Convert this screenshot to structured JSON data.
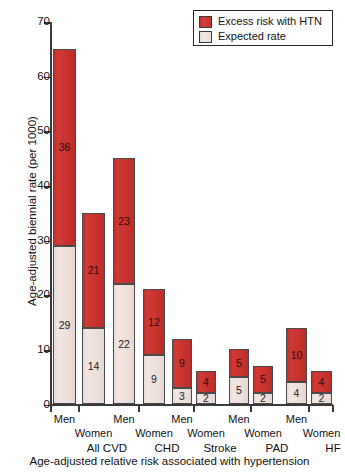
{
  "chart_data": {
    "type": "bar",
    "title": "",
    "subtitle": "",
    "xlabel": "Age-adjusted relative risk associated with hypertension",
    "ylabel": "Age-adjusted biennial rate (per 1000)",
    "ylim": [
      0,
      70
    ],
    "yticks": [
      0,
      10,
      20,
      30,
      40,
      50,
      60,
      70
    ],
    "grid": false,
    "stacked": true,
    "legend_position": "top-right",
    "categories": [
      "All CVD Men",
      "All CVD Women",
      "CHD Men",
      "CHD Women",
      "Stroke Men",
      "Stroke Women",
      "PAD Men",
      "PAD Women",
      "HF Men",
      "HF Women"
    ],
    "groups": [
      {
        "name": "All CVD",
        "bars": [
          {
            "sex": "Men",
            "expected": 29,
            "excess": 36,
            "total": 65
          },
          {
            "sex": "Women",
            "expected": 14,
            "excess": 21,
            "total": 35
          }
        ]
      },
      {
        "name": "CHD",
        "bars": [
          {
            "sex": "Men",
            "expected": 22,
            "excess": 23,
            "total": 45
          },
          {
            "sex": "Women",
            "expected": 9,
            "excess": 12,
            "total": 21
          }
        ]
      },
      {
        "name": "Stroke",
        "bars": [
          {
            "sex": "Men",
            "expected": 3,
            "excess": 9,
            "total": 12
          },
          {
            "sex": "Women",
            "expected": 2,
            "excess": 4,
            "total": 6
          }
        ]
      },
      {
        "name": "PAD",
        "bars": [
          {
            "sex": "Men",
            "expected": 5,
            "excess": 5,
            "total": 10
          },
          {
            "sex": "Women",
            "expected": 2,
            "excess": 5,
            "total": 7
          }
        ]
      },
      {
        "name": "HF",
        "bars": [
          {
            "sex": "Men",
            "expected": 4,
            "excess": 10,
            "total": 14
          },
          {
            "sex": "Women",
            "expected": 2,
            "excess": 4,
            "total": 6
          }
        ]
      }
    ],
    "series": [
      {
        "name": "Excess risk with HTN",
        "color": "#c93430",
        "values": [
          36,
          21,
          23,
          12,
          9,
          4,
          5,
          5,
          10,
          4
        ]
      },
      {
        "name": "Expected rate",
        "color": "#eee0db",
        "values": [
          29,
          14,
          22,
          9,
          3,
          2,
          5,
          2,
          4,
          2
        ]
      }
    ]
  },
  "legend": {
    "items": [
      {
        "label": "Excess risk with HTN",
        "color": "#c93430"
      },
      {
        "label": "Expected rate",
        "color": "#eee0db"
      }
    ]
  },
  "axes": {
    "y_title": "Age-adjusted biennial rate (per 1000)",
    "y_ticks": [
      "70",
      "60",
      "50",
      "40",
      "30",
      "20",
      "10",
      "0"
    ]
  },
  "caption": "Age-adjusted relative risk associated with hypertension"
}
